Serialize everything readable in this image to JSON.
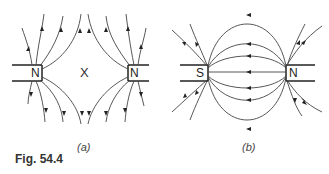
{
  "figure": {
    "caption": "Fig. 54.4",
    "panels": [
      {
        "id": "a",
        "label": "(a)",
        "left_pole": "N",
        "right_pole": "N",
        "neutral_point": "X",
        "description": "Field lines between two like (north) poles facing each other; lines repel, neutral point X between them"
      },
      {
        "id": "b",
        "label": "(b)",
        "left_pole": "S",
        "right_pole": "N",
        "description": "Field lines between unlike poles; lines run from N to S across the gap"
      }
    ]
  },
  "colors": {
    "line": "#333333",
    "background": "#ffffff"
  }
}
